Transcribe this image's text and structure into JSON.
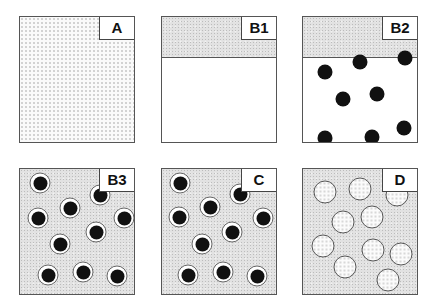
{
  "figure": {
    "panels": [
      {
        "id": "A",
        "label": "A",
        "fill": "fine-dotted",
        "band": false,
        "particles": []
      },
      {
        "id": "B1",
        "label": "B1",
        "fill": "white",
        "band": true,
        "band_fill": "speckled-gray",
        "particles": []
      },
      {
        "id": "B2",
        "label": "B2",
        "fill": "white",
        "band": true,
        "band_fill": "speckled-gray",
        "particle_style": "solid-black",
        "particles": [
          [
            22,
            55
          ],
          [
            57,
            45
          ],
          [
            102,
            41
          ],
          [
            40,
            82
          ],
          [
            74,
            77
          ],
          [
            22,
            121
          ],
          [
            69,
            120
          ],
          [
            101,
            111
          ],
          [
            47,
            141
          ],
          [
            94,
            137
          ]
        ]
      },
      {
        "id": "B3",
        "label": "B3",
        "fill": "speckled-gray",
        "band": false,
        "particle_style": "black-core-white-ring",
        "particles": [
          [
            20,
            14
          ],
          [
            80,
            26
          ],
          [
            50,
            39
          ],
          [
            18,
            49
          ],
          [
            104,
            49
          ],
          [
            76,
            63
          ],
          [
            40,
            75
          ],
          [
            28,
            106
          ],
          [
            63,
            103
          ],
          [
            97,
            107
          ]
        ]
      },
      {
        "id": "C",
        "label": "C",
        "fill": "speckled-gray",
        "band": false,
        "particle_style": "black-core-white-ring",
        "particles": [
          [
            18,
            14
          ],
          [
            78,
            25
          ],
          [
            48,
            38
          ],
          [
            17,
            48
          ],
          [
            101,
            49
          ],
          [
            70,
            63
          ],
          [
            40,
            75
          ],
          [
            26,
            106
          ],
          [
            61,
            103
          ],
          [
            95,
            107
          ]
        ]
      },
      {
        "id": "D",
        "label": "D",
        "fill": "speckled-gray",
        "band": false,
        "particle_style": "hollow-dotted-ring",
        "particles": [
          [
            22,
            23
          ],
          [
            57,
            20
          ],
          [
            94,
            26
          ],
          [
            40,
            53
          ],
          [
            69,
            48
          ],
          [
            20,
            77
          ],
          [
            70,
            81
          ],
          [
            98,
            85
          ],
          [
            42,
            98
          ],
          [
            85,
            111
          ]
        ]
      }
    ],
    "colors": {
      "border": "#555555",
      "particle": "#111111",
      "gray_fill": "#e2e2e2",
      "background": "#ffffff"
    }
  }
}
